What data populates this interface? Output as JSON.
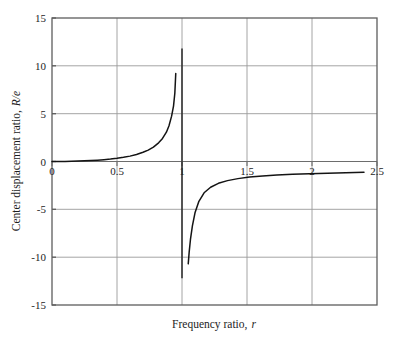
{
  "chart_data": {
    "type": "line",
    "title": "",
    "xlabel": "Frequency ratio, r",
    "xlabel_plain": "Frequency ratio,",
    "xlabel_italic": "r",
    "ylabel": "Center displacement ratio, R/e",
    "ylabel_plain": "Center displacement ratio,",
    "ylabel_italic": "R/e",
    "xlim": [
      0,
      2.5
    ],
    "ylim": [
      -15,
      15
    ],
    "xticks": [
      0,
      0.5,
      1,
      1.5,
      2,
      2.5
    ],
    "xtick_labels": [
      "0",
      "0.5",
      "1",
      "1.5",
      "2",
      "2.5"
    ],
    "yticks": [
      -15,
      -10,
      -5,
      0,
      5,
      10,
      15
    ],
    "ytick_labels": [
      "-15",
      "-10",
      "-5",
      "0",
      "5",
      "10",
      "15"
    ],
    "grid": true,
    "legend": null,
    "curve_color": "#141414",
    "grid_color": "#9a9a9a",
    "frame_color": "#5d5d5d",
    "background_color": "#ffffff",
    "asymptote_x": 1,
    "annotations": [],
    "series": [
      {
        "name": "R/e = r^2 / (r^2 - 1)  (left branch)",
        "x": [
          0.0,
          0.05,
          0.1,
          0.15,
          0.2,
          0.25,
          0.3,
          0.35,
          0.4,
          0.45,
          0.5,
          0.55,
          0.6,
          0.65,
          0.7,
          0.74,
          0.78,
          0.82,
          0.85,
          0.88,
          0.9,
          0.92,
          0.935,
          0.945,
          0.952
        ],
        "y": [
          0.0,
          0.0025,
          0.0101,
          0.023,
          0.0417,
          0.0667,
          0.0989,
          0.1396,
          0.1905,
          0.2538,
          0.3333,
          0.4346,
          0.5625,
          0.7326,
          0.9608,
          1.1924,
          1.5049,
          1.9502,
          2.4102,
          3.062,
          3.7368,
          4.74,
          5.816,
          7.156,
          9.2
        ]
      },
      {
        "name": "R/e = r^2 / (r^2 - 1)  (right branch)",
        "x": [
          1.048,
          1.055,
          1.065,
          1.08,
          1.1,
          1.13,
          1.17,
          1.22,
          1.28,
          1.35,
          1.43,
          1.52,
          1.62,
          1.73,
          1.85,
          1.98,
          2.12,
          2.26,
          2.4
        ],
        "y": [
          -10.7,
          -9.5,
          -8.15,
          -6.72,
          -5.36,
          -4.16,
          -3.27,
          -2.69,
          -2.28,
          -2.0,
          -1.79,
          -1.63,
          -1.51,
          -1.42,
          -1.34,
          -1.27,
          -1.22,
          -1.17,
          -1.13
        ]
      }
    ],
    "asymptote_segment_top": {
      "x": 1,
      "y_from": 0,
      "y_to": 11.8
    },
    "asymptote_segment_bottom": {
      "x": 1,
      "y_from": 0,
      "y_to": -12.2
    }
  }
}
